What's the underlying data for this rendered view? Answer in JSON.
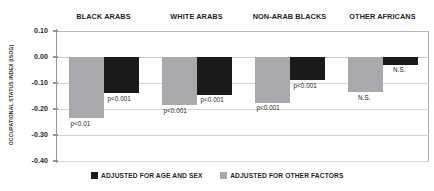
{
  "chart_data": {
    "type": "bar",
    "title": "",
    "xlabel": "",
    "ylabel": "OCCUPATIONAL STATUS INDEX (ISOG)",
    "ylim": [
      -0.4,
      0.1
    ],
    "grid": true,
    "legend_position": "bottom-center",
    "categories": [
      "BLACK ARABS",
      "WHITE ARABS",
      "NON-ARAB BLACKS",
      "OTHER AFRICANS"
    ],
    "y_ticks": [
      "0.10",
      "0.00",
      "-0.10",
      "-0.20",
      "-0.30",
      "-0.40"
    ],
    "y_tick_values": [
      0.1,
      0.0,
      -0.1,
      -0.2,
      -0.3,
      -0.4
    ],
    "series": [
      {
        "name": "ADJUSTED FOR OTHER FACTORS",
        "color": "#a7a9ac",
        "values": [
          -0.235,
          -0.185,
          -0.175,
          -0.135
        ],
        "annotations": [
          "p<0.01",
          "p<0.001",
          "p<0.001",
          "N.S."
        ]
      },
      {
        "name": "ADJUSTED FOR AGE AND SEX",
        "color": "#1a1a1a",
        "values": [
          -0.14,
          -0.145,
          -0.09,
          -0.03
        ],
        "annotations": [
          "p<0.001",
          "p<0.001",
          "p<0.001",
          "N.S."
        ]
      }
    ]
  },
  "legend": {
    "items": [
      {
        "label": "ADJUSTED FOR AGE AND SEX",
        "color": "#1a1a1a"
      },
      {
        "label": "ADJUSTED FOR OTHER FACTORS",
        "color": "#a7a9ac"
      }
    ]
  }
}
